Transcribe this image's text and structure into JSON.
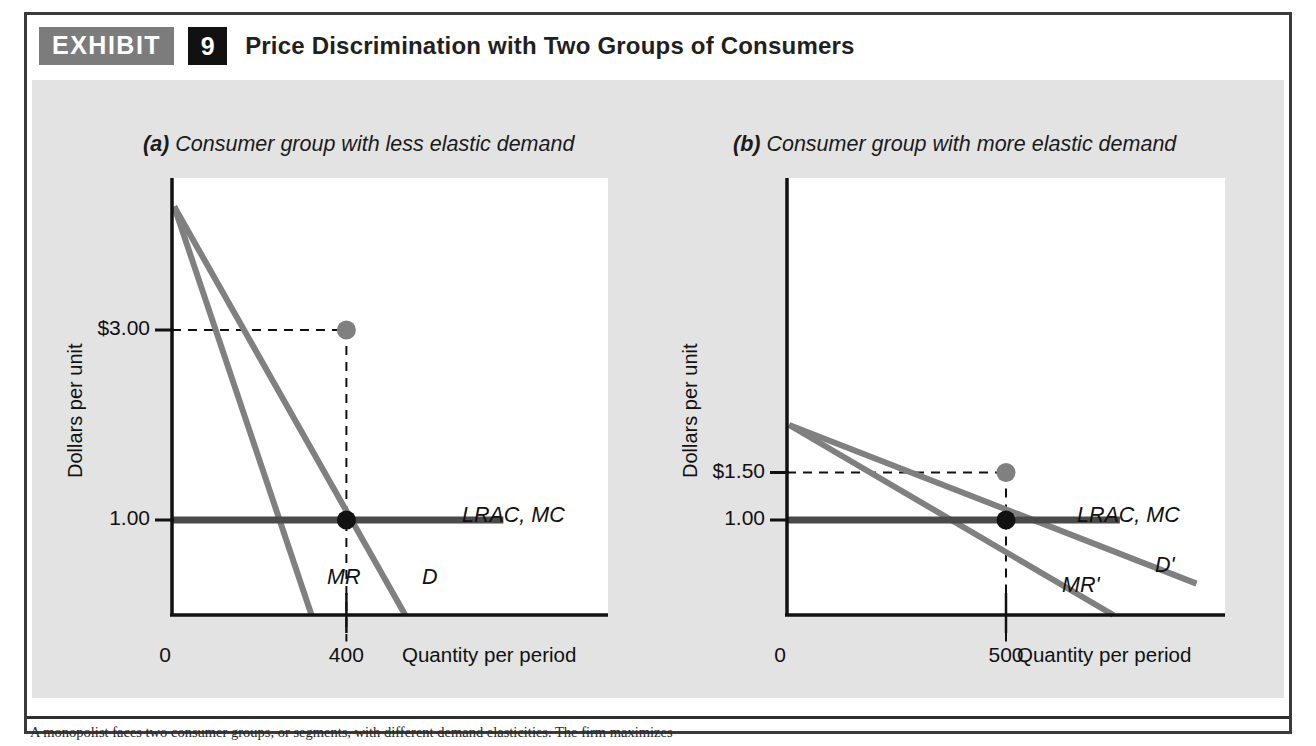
{
  "exhibit": {
    "badge_label": "EXHIBIT",
    "number": "9",
    "title": "Price Discrimination with Two Groups of Consumers",
    "caption": "A monopolist faces two consumer groups, or segments, with different demand elasticities. The firm maximizes",
    "colors": {
      "frame": "#3a3a3a",
      "badge_bg": "#7c7c7c",
      "number_bg": "#111111",
      "panel_bg": "#e3e3e3",
      "plot_bg": "#ffffff",
      "curve_gray": "#808080",
      "cost_line": "#4a4a4a",
      "axis": "#111111",
      "point_price": "#808080",
      "point_quantity": "#111111"
    }
  },
  "chart_data": [
    {
      "id": "panel-a",
      "type": "line",
      "title": "(a) Consumer group with less elastic demand",
      "title_prefix": "(a)",
      "title_rest": " Consumer group with less elastic demand",
      "xlabel": "Quantity per period",
      "ylabel": "Dollars per unit",
      "origin_label": "0",
      "ytick_labels": [
        "$3.00",
        "1.00"
      ],
      "ytick_values": [
        3.0,
        1.0
      ],
      "xtick_labels": [
        "400"
      ],
      "xtick_values": [
        400
      ],
      "xlim": [
        0,
        1000
      ],
      "ylim": [
        0,
        4.6
      ],
      "grid": false,
      "series": [
        {
          "name": "D",
          "label": "D",
          "role": "demand",
          "points": [
            [
              5,
              4.3
            ],
            [
              535,
              0.0
            ]
          ]
        },
        {
          "name": "MR",
          "label": "MR",
          "role": "marginal-revenue",
          "points": [
            [
              5,
              4.3
            ],
            [
              320,
              0.0
            ]
          ]
        },
        {
          "name": "LRAC, MC",
          "label": "LRAC, MC",
          "role": "cost",
          "points": [
            [
              0,
              1.0
            ],
            [
              760,
              1.0
            ]
          ]
        }
      ],
      "annotations": [
        {
          "name": "price-point",
          "x": 400,
          "y": 3.0,
          "color": "#808080",
          "label": "$3.00"
        },
        {
          "name": "quantity-point",
          "x": 400,
          "y": 1.0,
          "color": "#111111",
          "label": "400"
        }
      ],
      "dashed_guides": [
        {
          "from": [
            0,
            3.0
          ],
          "to": [
            400,
            3.0
          ]
        },
        {
          "from": [
            400,
            3.0
          ],
          "to": [
            400,
            -0.28
          ]
        }
      ]
    },
    {
      "id": "panel-b",
      "type": "line",
      "title": "(b) Consumer group with more elastic demand",
      "title_prefix": "(b)",
      "title_rest": " Consumer group with more elastic demand",
      "xlabel": "Quantity per period",
      "ylabel": "Dollars per unit",
      "origin_label": "0",
      "ytick_labels": [
        "$1.50",
        "1.00"
      ],
      "ytick_values": [
        1.5,
        1.0
      ],
      "xtick_labels": [
        "500"
      ],
      "xtick_values": [
        500
      ],
      "xlim": [
        0,
        1000
      ],
      "ylim": [
        0,
        4.6
      ],
      "grid": false,
      "series": [
        {
          "name": "D'",
          "label": "D'",
          "role": "demand",
          "points": [
            [
              5,
              2.0
            ],
            [
              935,
              0.33
            ]
          ]
        },
        {
          "name": "MR'",
          "label": "MR'",
          "role": "marginal-revenue",
          "points": [
            [
              5,
              2.0
            ],
            [
              745,
              0.0
            ]
          ]
        },
        {
          "name": "LRAC, MC",
          "label": "LRAC, MC",
          "role": "cost",
          "points": [
            [
              0,
              1.0
            ],
            [
              760,
              1.0
            ]
          ]
        }
      ],
      "annotations": [
        {
          "name": "price-point",
          "x": 500,
          "y": 1.5,
          "color": "#808080",
          "label": "$1.50"
        },
        {
          "name": "quantity-point",
          "x": 500,
          "y": 1.0,
          "color": "#111111",
          "label": "500"
        }
      ],
      "dashed_guides": [
        {
          "from": [
            0,
            1.5
          ],
          "to": [
            500,
            1.5
          ]
        },
        {
          "from": [
            500,
            1.5
          ],
          "to": [
            500,
            -0.28
          ]
        }
      ]
    }
  ]
}
